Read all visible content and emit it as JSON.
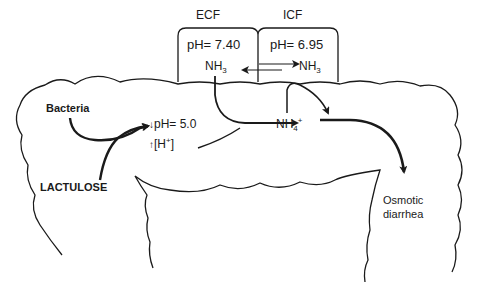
{
  "compartments": {
    "ecf": {
      "title": "ECF",
      "ph": "pH= 7.40",
      "species": "NH",
      "species_sub": "3"
    },
    "icf": {
      "title": "ICF",
      "ph": "pH= 6.95",
      "species": "NH",
      "species_sub": "3"
    }
  },
  "colon": {
    "bacteria": "Bacteria",
    "lactulose": "LACTULOSE",
    "ph_change": {
      "arrow": "↓",
      "text": "pH= 5.0"
    },
    "h_change": {
      "arrow": "↑",
      "text_open": "[H",
      "sup": "+",
      "text_close": "]"
    },
    "ammonium": {
      "text": "NH",
      "sub": "4",
      "sup": "+"
    },
    "outcome": {
      "line1": "Osmotic",
      "line2": "diarrhea"
    }
  },
  "colors": {
    "ink": "#1a1a1a",
    "background": "#ffffff"
  }
}
